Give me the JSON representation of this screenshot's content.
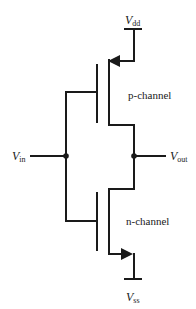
{
  "diagram": {
    "labels": {
      "vdd": {
        "main": "V",
        "sub": "dd"
      },
      "vss": {
        "main": "V",
        "sub": "ss"
      },
      "vin": {
        "main": "V",
        "sub": "in"
      },
      "vout": {
        "main": "V",
        "sub": "out"
      },
      "p_channel": "p-channel",
      "n_channel": "n-channel"
    },
    "colors": {
      "line": "#1a1a1a",
      "background": "#ffffff"
    }
  }
}
